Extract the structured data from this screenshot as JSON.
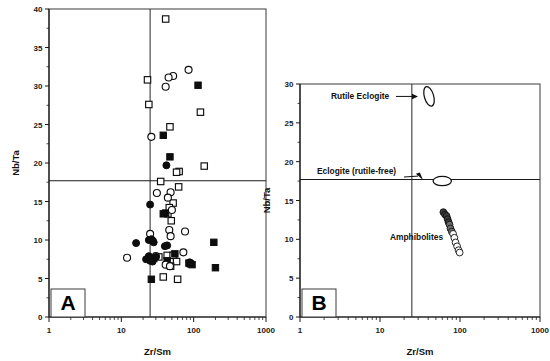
{
  "figure": {
    "background": "#ffffff",
    "width": 550,
    "height": 361
  },
  "colors": {
    "axis": "#1a1a1a",
    "frame": "#3a3a3a",
    "symbol": "#0d0d0d",
    "open_fill": "#ffffff"
  },
  "panels": [
    {
      "id": "A",
      "letter": "A",
      "xlabel": "Zr/Sm",
      "ylabel": "Nb/Ta",
      "xscale": "log",
      "xlim": [
        1,
        1000
      ],
      "ylim": [
        0,
        40
      ],
      "xticks": [
        1,
        10,
        100,
        1000
      ],
      "xticklabels": [
        "1",
        "10",
        "100",
        "1000"
      ],
      "yticks": [
        0,
        5,
        10,
        15,
        20,
        25,
        30,
        35,
        40
      ],
      "yticklabels": [
        "0",
        "5",
        "10",
        "15",
        "20",
        "25",
        "30",
        "35",
        "40"
      ],
      "reference_lines": {
        "vertical_x": 25,
        "horizontal_y": 17.7
      }
    },
    {
      "id": "B",
      "letter": "B",
      "xlabel": "Zr/Sm",
      "ylabel": "Nb/Ta",
      "xscale": "log",
      "xlim": [
        1,
        1000
      ],
      "ylim": [
        0,
        30
      ],
      "xticks": [
        1,
        10,
        100,
        1000
      ],
      "xticklabels": [
        "1",
        "10",
        "100",
        "1000"
      ],
      "yticks": [
        0,
        5,
        10,
        15,
        20,
        25,
        30
      ],
      "yticklabels": [
        "0",
        "5",
        "10",
        "15",
        "20",
        "25",
        "30"
      ],
      "reference_lines": {
        "vertical_x": 25,
        "horizontal_y": 17.7
      },
      "annotations": [
        {
          "name": "rutile-eclogite-label",
          "text": "Rutile  Eclogite"
        },
        {
          "name": "eclogite-rutile-free-label",
          "text": "Eclogite  (rutile-free)"
        },
        {
          "name": "amphibolites-label",
          "text": "Amphibolites"
        }
      ]
    }
  ],
  "chart_data": [
    {
      "type": "scatter",
      "panel": "A",
      "title": "",
      "xlabel": "Zr/Sm",
      "ylabel": "Nb/Ta",
      "xscale": "log",
      "xlim": [
        1,
        1000
      ],
      "ylim": [
        0,
        40
      ],
      "grid": false,
      "legend": "none",
      "reference_lines": {
        "vertical_x": 25,
        "horizontal_y": 17.7
      },
      "series": [
        {
          "name": "open-square",
          "marker": "open square",
          "points": [
            [
              41,
              38.7
            ],
            [
              23,
              30.8
            ],
            [
              24,
              27.6
            ],
            [
              47,
              24.7
            ],
            [
              124,
              26.6
            ],
            [
              140,
              19.6
            ],
            [
              63,
              18.9
            ],
            [
              58,
              18.8
            ],
            [
              35,
              17.6
            ],
            [
              62,
              16.9
            ],
            [
              52,
              14.8
            ],
            [
              46,
              14.2
            ],
            [
              44,
              13.4
            ],
            [
              49,
              12.5
            ],
            [
              43,
              8.0
            ],
            [
              52,
              8.0
            ],
            [
              58,
              7.2
            ],
            [
              48,
              6.6
            ],
            [
              38,
              5.2
            ],
            [
              60,
              4.9
            ],
            [
              28,
              7.6
            ],
            [
              33,
              7.8
            ]
          ]
        },
        {
          "name": "filled-square",
          "marker": "filled square",
          "points": [
            [
              115,
              30.1
            ],
            [
              38,
              23.6
            ],
            [
              47,
              20.8
            ],
            [
              41,
              13.5
            ],
            [
              38,
              13.4
            ],
            [
              190,
              9.7
            ],
            [
              55,
              8.2
            ],
            [
              86,
              7.0
            ],
            [
              90,
              6.9
            ],
            [
              95,
              6.8
            ],
            [
              200,
              6.4
            ],
            [
              26,
              4.9
            ],
            [
              43,
              7.3
            ]
          ]
        },
        {
          "name": "open-circle",
          "marker": "open circle",
          "points": [
            [
              85,
              32.1
            ],
            [
              52,
              31.3
            ],
            [
              45,
              31.1
            ],
            [
              41,
              29.9
            ],
            [
              26,
              23.4
            ],
            [
              31,
              16.1
            ],
            [
              48,
              16.2
            ],
            [
              44,
              15.5
            ],
            [
              50,
              13.9
            ],
            [
              46,
              11.3
            ],
            [
              76,
              11.1
            ],
            [
              48,
              10.5
            ],
            [
              25,
              10.8
            ],
            [
              12,
              7.7
            ],
            [
              72,
              8.4
            ],
            [
              41,
              6.8
            ],
            [
              47,
              6.6
            ],
            [
              30,
              7.9
            ],
            [
              27,
              9.9
            ]
          ]
        },
        {
          "name": "filled-circle",
          "marker": "filled circle",
          "points": [
            [
              42,
              19.7
            ],
            [
              25,
              14.6
            ],
            [
              16,
              9.6
            ],
            [
              24,
              10.0
            ],
            [
              26,
              10.1
            ],
            [
              28,
              9.7
            ],
            [
              43,
              9.3
            ],
            [
              22,
              7.5
            ],
            [
              25,
              7.3
            ],
            [
              27,
              7.2
            ],
            [
              30,
              7.8
            ],
            [
              24,
              7.9
            ],
            [
              88,
              7.1
            ],
            [
              40,
              9.2
            ]
          ]
        }
      ]
    },
    {
      "type": "scatter",
      "panel": "B",
      "title": "",
      "xlabel": "Zr/Sm",
      "ylabel": "Nb/Ta",
      "xscale": "log",
      "xlim": [
        1,
        1000
      ],
      "ylim": [
        0,
        30
      ],
      "grid": false,
      "legend": "none",
      "reference_lines": {
        "vertical_x": 25,
        "horizontal_y": 17.7
      },
      "fields": [
        {
          "name": "Rutile  Eclogite",
          "shape": "ellipse",
          "center": [
            41,
            28.4
          ],
          "x_extent": [
            36,
            47
          ],
          "y_extent": [
            27.0,
            29.6
          ],
          "orientation": "near-vertical"
        },
        {
          "name": "Eclogite  (rutile-free)",
          "shape": "ellipse",
          "center": [
            60,
            17.5
          ],
          "x_extent": [
            46,
            78
          ],
          "y_extent": [
            16.9,
            18.1
          ],
          "orientation": "horizontal"
        }
      ],
      "series": [
        {
          "name": "Amphibolites",
          "marker": "circle (dark to open gradient)",
          "points": [
            [
              62,
              13.5
            ],
            [
              65,
              13.2
            ],
            [
              68,
              13.0
            ],
            [
              70,
              12.6
            ],
            [
              72,
              12.2
            ],
            [
              74,
              11.9
            ],
            [
              76,
              11.4
            ],
            [
              79,
              11.0
            ],
            [
              82,
              10.7
            ],
            [
              85,
              10.2
            ],
            [
              88,
              9.6
            ],
            [
              92,
              9.1
            ],
            [
              96,
              8.6
            ],
            [
              99,
              8.3
            ]
          ]
        }
      ]
    }
  ]
}
